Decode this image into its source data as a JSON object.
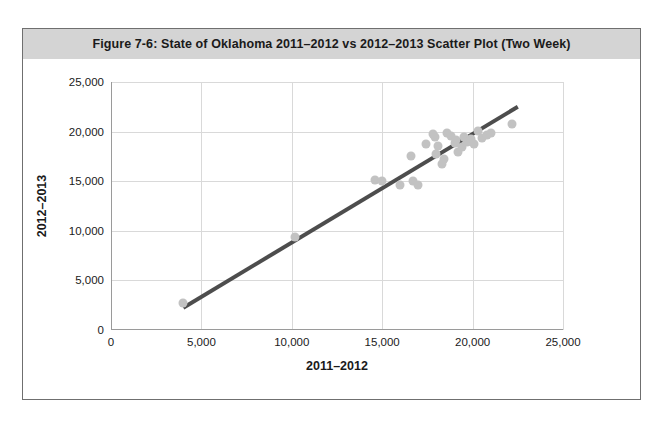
{
  "figure": {
    "title": "Figure 7-6: State of Oklahoma 2011–2012 vs 2012–2013 Scatter Plot (Two Week)",
    "frame_border_color": "#6f6f6f",
    "title_band_color": "#d4d4d4"
  },
  "chart_data": {
    "type": "scatter",
    "title": "Figure 7-6: State of Oklahoma 2011–2012 vs 2012–2013 Scatter Plot (Two Week)",
    "xlabel": "2011–2012",
    "ylabel": "2012–2013",
    "xlim": [
      0,
      25000
    ],
    "ylim": [
      0,
      25000
    ],
    "xticks": [
      0,
      5000,
      10000,
      15000,
      20000,
      25000
    ],
    "yticks": [
      0,
      5000,
      10000,
      15000,
      20000,
      25000
    ],
    "xtick_labels": [
      "0",
      "5,000",
      "10,000",
      "15,000",
      "20,000",
      "25,000"
    ],
    "ytick_labels": [
      "0",
      "5,000",
      "10,000",
      "15,000",
      "20,000",
      "25,000"
    ],
    "grid": true,
    "grid_color": "#d9d9d9",
    "legend": null,
    "point_color": "#c2c2c2",
    "point_size": 9,
    "series": [
      {
        "name": "Two Week Totals",
        "points": [
          [
            4000,
            2700
          ],
          [
            10200,
            9400
          ],
          [
            14600,
            15100
          ],
          [
            15000,
            15000
          ],
          [
            16000,
            14600
          ],
          [
            16600,
            17500
          ],
          [
            16700,
            15000
          ],
          [
            17000,
            14600
          ],
          [
            17400,
            18700
          ],
          [
            17800,
            19800
          ],
          [
            17900,
            19500
          ],
          [
            18000,
            17700
          ],
          [
            18100,
            18500
          ],
          [
            18300,
            16700
          ],
          [
            18400,
            17200
          ],
          [
            18600,
            19900
          ],
          [
            18800,
            19600
          ],
          [
            19000,
            18900
          ],
          [
            19100,
            19200
          ],
          [
            19200,
            17900
          ],
          [
            19400,
            18400
          ],
          [
            19500,
            19500
          ],
          [
            19700,
            19000
          ],
          [
            19900,
            19300
          ],
          [
            20100,
            18800
          ],
          [
            20300,
            20100
          ],
          [
            20500,
            19400
          ],
          [
            20800,
            19700
          ],
          [
            21000,
            19900
          ],
          [
            22200,
            20800
          ]
        ]
      }
    ],
    "trendline": {
      "name": "Linear trend",
      "color": "#4d4d4d",
      "width": 4,
      "x_start": 4000,
      "y_start": 2250,
      "x_end": 22500,
      "y_end": 22500
    }
  }
}
